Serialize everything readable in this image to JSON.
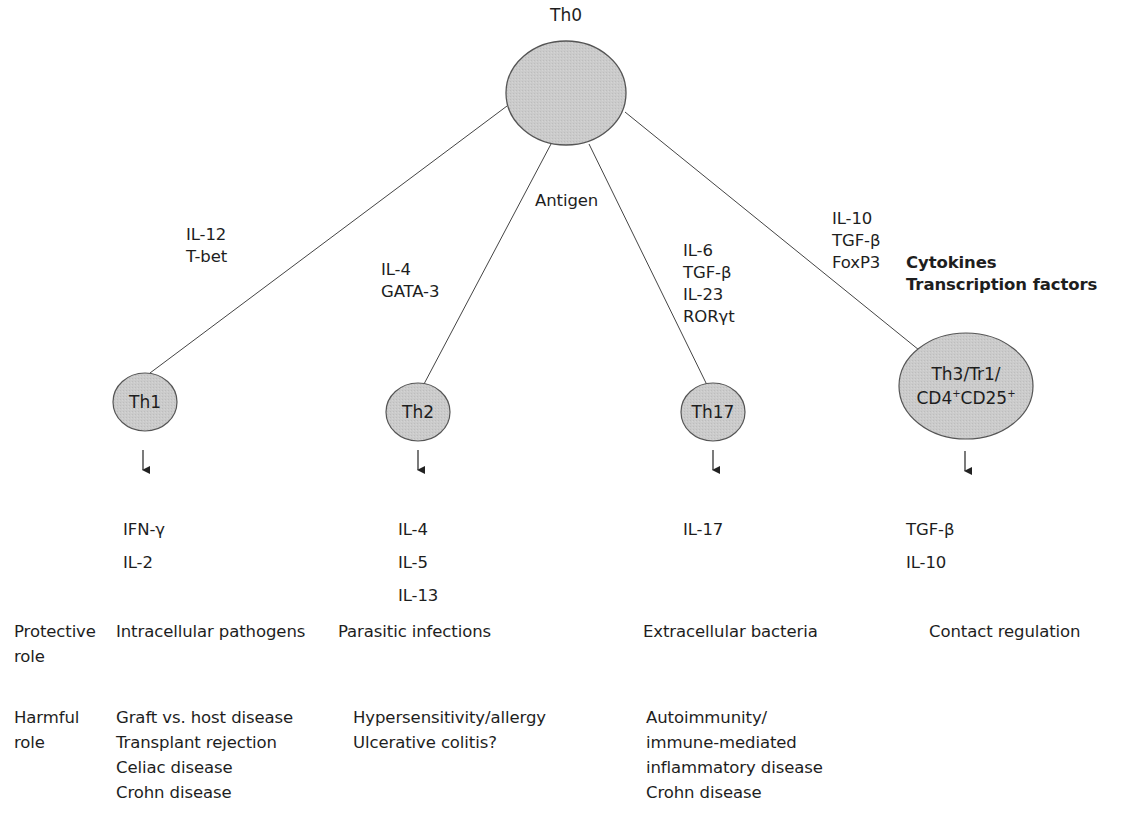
{
  "diagram": {
    "root": {
      "label": "Th0"
    },
    "antigen_label": "Antigen",
    "legend": {
      "line1": "Cytokines",
      "line2": "Transcription factors"
    },
    "branches": [
      {
        "node": "Th1",
        "drivers": [
          "IL-12",
          "T-bet"
        ],
        "products": [
          "IFN-γ",
          "IL-2"
        ],
        "protective_role": [
          "Intracellular pathogens"
        ],
        "harmful_role": [
          "Graft vs. host disease",
          "Transplant rejection",
          "Celiac disease",
          "Crohn disease"
        ]
      },
      {
        "node": "Th2",
        "drivers": [
          "IL-4",
          "GATA-3"
        ],
        "products": [
          "IL-4",
          "IL-5",
          "IL-13"
        ],
        "protective_role": [
          "Parasitic infections"
        ],
        "harmful_role": [
          "Hypersensitivity/allergy",
          "Ulcerative colitis?"
        ]
      },
      {
        "node": "Th17",
        "drivers": [
          "IL-6",
          "TGF-β",
          "IL-23",
          "RORγt"
        ],
        "products": [
          "IL-17"
        ],
        "protective_role": [
          "Extracellular bacteria"
        ],
        "harmful_role": [
          "Autoimmunity/",
          "immune-mediated",
          "inflammatory disease",
          "Crohn disease"
        ]
      },
      {
        "node": "Th3/Tr1/",
        "node_line2_a": "CD4",
        "node_line2_sup_a": "+",
        "node_line2_b": "CD25",
        "node_line2_sup_b": "+",
        "drivers": [
          "IL-10",
          "TGF-β",
          "FoxP3"
        ],
        "products": [
          "TGF-β",
          "IL-10"
        ],
        "protective_role": [
          "Contact regulation"
        ],
        "harmful_role": []
      }
    ],
    "row_labels": {
      "protective": [
        "Protective",
        "role"
      ],
      "harmful": [
        "Harmful",
        "role"
      ]
    },
    "colors": {
      "node_fill": "#c9c9c9",
      "node_stroke": "#555555",
      "line": "#444444",
      "text": "#1e1e1e"
    }
  }
}
